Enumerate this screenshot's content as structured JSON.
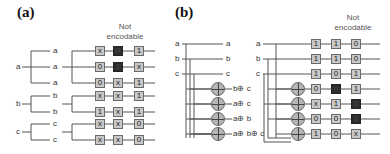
{
  "panel_a": {
    "label": "(a)",
    "header": [
      "Not",
      "encodable"
    ],
    "inputs": [
      "a",
      "b",
      "c"
    ],
    "fanout_labels": [
      "a",
      "a",
      "a",
      "b",
      "b",
      "c",
      "c"
    ],
    "rows": [
      {
        "cells": [
          "x",
          "0",
          "1"
        ],
        "dark": [
          false,
          true,
          false
        ]
      },
      {
        "cells": [
          "0",
          "1",
          "x"
        ],
        "dark": [
          false,
          true,
          false
        ]
      },
      {
        "cells": [
          "0",
          "x",
          "1"
        ],
        "dark": [
          false,
          false,
          false
        ]
      },
      {
        "cells": [
          "x",
          "x",
          "1"
        ],
        "dark": [
          false,
          false,
          false
        ]
      },
      {
        "cells": [
          "1",
          "x",
          "1"
        ],
        "dark": [
          false,
          false,
          false
        ]
      },
      {
        "cells": [
          "x",
          "x",
          "0"
        ],
        "dark": [
          false,
          false,
          false
        ]
      },
      {
        "cells": [
          "x",
          "x",
          "0"
        ],
        "dark": [
          false,
          false,
          false
        ]
      }
    ]
  },
  "panel_b": {
    "label": "(b)",
    "header": [
      "Not",
      "encodable"
    ],
    "inputs": [
      "a",
      "b",
      "c"
    ],
    "output_labels": [
      "a",
      "b",
      "c",
      "b⊕ c",
      "a⊕ c",
      "a⊕ b",
      "a⊕ b⊕ c"
    ],
    "second_inputs": [
      "a",
      "b",
      "c"
    ],
    "rows": [
      {
        "cells": [
          "1",
          "1",
          "0"
        ],
        "dark": [
          false,
          false,
          false
        ]
      },
      {
        "cells": [
          "1",
          "1",
          "0"
        ],
        "dark": [
          false,
          false,
          false
        ]
      },
      {
        "cells": [
          "1",
          "0",
          "1"
        ],
        "dark": [
          false,
          false,
          false
        ]
      },
      {
        "cells": [
          "0",
          "0",
          "1"
        ],
        "dark": [
          false,
          true,
          false
        ]
      },
      {
        "cells": [
          "x",
          "1",
          "0"
        ],
        "dark": [
          false,
          false,
          true
        ]
      },
      {
        "cells": [
          "0",
          "0",
          "1"
        ],
        "dark": [
          false,
          false,
          true
        ]
      },
      {
        "cells": [
          "1",
          "0",
          "x"
        ],
        "dark": [
          false,
          false,
          false
        ]
      }
    ]
  }
}
